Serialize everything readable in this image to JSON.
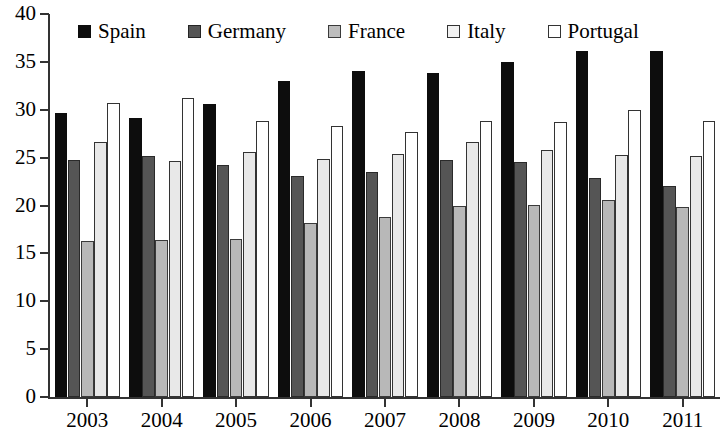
{
  "chart_data": {
    "type": "bar",
    "title": "",
    "subtitle": "",
    "xlabel": "",
    "ylabel": "",
    "ylim": [
      0,
      40
    ],
    "ytick_step": 5,
    "yticks": [
      "0",
      "5",
      "10",
      "15",
      "20",
      "25",
      "30",
      "35",
      "40"
    ],
    "grid": false,
    "legend_position": "top",
    "categories": [
      "2003",
      "2004",
      "2005",
      "2006",
      "2007",
      "2008",
      "2009",
      "2010",
      "2011"
    ],
    "series": [
      {
        "name": "Spain",
        "color": "#0d0d0d",
        "swatch": "filled-black",
        "values": [
          29.7,
          29.1,
          30.6,
          33.0,
          34.0,
          33.8,
          35.0,
          36.1,
          36.1
        ]
      },
      {
        "name": "Germany",
        "color": "#555555",
        "swatch": "filled-dark-gray",
        "values": [
          24.8,
          25.2,
          24.2,
          23.1,
          23.5,
          24.8,
          24.5,
          22.9,
          22.0
        ]
      },
      {
        "name": "France",
        "color": "#b8b8b8",
        "swatch": "filled-light-gray",
        "values": [
          16.3,
          16.4,
          16.5,
          18.2,
          18.8,
          19.9,
          20.1,
          20.6,
          19.8
        ]
      },
      {
        "name": "Italy",
        "color": "#e8e8e8",
        "swatch": "outline-very-light",
        "values": [
          26.6,
          24.6,
          25.6,
          24.9,
          25.4,
          26.6,
          25.8,
          25.3,
          25.2
        ]
      },
      {
        "name": "Portugal",
        "color": "#ffffff",
        "swatch": "outline-white",
        "values": [
          30.7,
          31.2,
          28.8,
          28.3,
          27.7,
          28.8,
          28.7,
          30.0,
          28.8
        ]
      }
    ]
  },
  "legend": {
    "entries": [
      {
        "label": "Spain"
      },
      {
        "label": "Germany"
      },
      {
        "label": "France"
      },
      {
        "label": "Italy"
      },
      {
        "label": "Portugal"
      }
    ]
  },
  "axes": {
    "y_tick_labels": [
      "40",
      "35",
      "30",
      "25",
      "20",
      "15",
      "10",
      "5",
      "0"
    ],
    "x_tick_labels": [
      "2003",
      "2004",
      "2005",
      "2006",
      "2007",
      "2008",
      "2009",
      "2010",
      "2011"
    ]
  }
}
